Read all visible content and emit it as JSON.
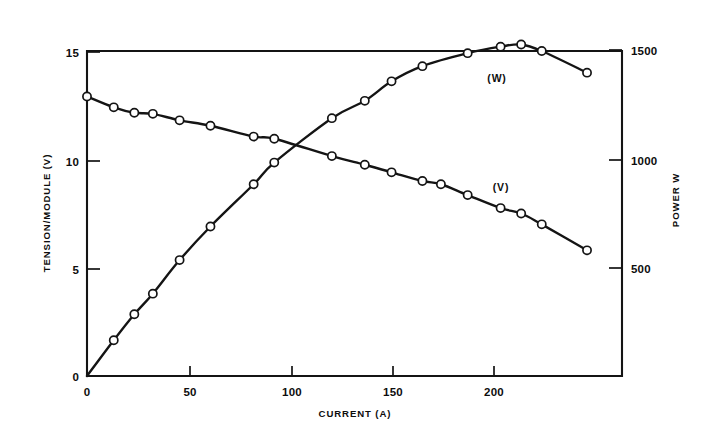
{
  "figure": {
    "background_color": "#ffffff",
    "ink_color": "#141414"
  },
  "axes": {
    "x": {
      "title": "CURRENT (A)",
      "tick_labels": [
        "0",
        "50",
        "100",
        "150",
        "200"
      ],
      "tick_values": [
        0,
        50,
        100,
        150,
        200
      ],
      "range": [
        0,
        260
      ]
    },
    "y_left": {
      "title": "TENSION/MODULE (V)",
      "tick_labels": [
        "0",
        "5",
        "10",
        "15"
      ],
      "tick_values": [
        0,
        5,
        10,
        15
      ],
      "range": [
        0,
        15.0
      ]
    },
    "y_right": {
      "title": "POWER  W",
      "tick_labels": [
        "500",
        "1000",
        "1500"
      ],
      "tick_values": [
        500,
        1000,
        1500
      ],
      "range": [
        0,
        1500
      ]
    }
  },
  "annotations": {
    "power_series_label": "(W)",
    "voltage_series_label": "(V)"
  },
  "chart_data": {
    "type": "line",
    "title": "",
    "subtitle": "",
    "xlabel": "CURRENT (A)",
    "ylabel": "TENSION/MODULE (V)",
    "ylabel_right": "POWER  W",
    "xlim": [
      0,
      260
    ],
    "ylim": [
      0,
      15.0
    ],
    "ylim_right": [
      0,
      1500
    ],
    "grid": false,
    "legend": "inline-annotations",
    "series": [
      {
        "name": "(V)",
        "axis": "left",
        "unit": "V",
        "marker": "open-circle",
        "x": [
          0,
          13,
          23,
          32,
          45,
          60,
          81,
          91,
          119,
          135,
          148,
          163,
          172,
          185,
          201,
          211,
          221,
          243
        ],
        "y": [
          12.9,
          12.4,
          12.15,
          12.1,
          11.8,
          11.55,
          11.05,
          10.95,
          10.15,
          9.75,
          9.4,
          9.0,
          8.85,
          8.35,
          7.75,
          7.5,
          7.0,
          5.8
        ]
      },
      {
        "name": "(W)",
        "axis": "right",
        "unit": "W",
        "marker": "open-circle",
        "x": [
          0,
          13,
          23,
          32,
          45,
          60,
          81,
          91,
          119,
          135,
          148,
          163,
          185,
          201,
          211,
          221,
          243
        ],
        "y": [
          0,
          165,
          285,
          380,
          535,
          690,
          885,
          985,
          1190,
          1270,
          1360,
          1430,
          1490,
          1520,
          1530,
          1500,
          1400
        ]
      }
    ]
  }
}
